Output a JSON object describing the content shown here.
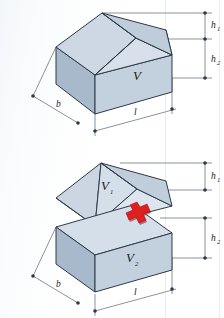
{
  "page": {
    "width": 224,
    "height": 318,
    "background": "#fdfdfd",
    "clipped_heading": "...icht Verfahren"
  },
  "figure": {
    "colors": {
      "face_light": "#d3dde8",
      "face_mid": "#c3d0dd",
      "face_dark": "#b3c2d2",
      "face_darkest": "#a8b9cb",
      "outline": "#2d3a46",
      "dimension_line": "#5a6672",
      "plus_sign": "#e02020",
      "plus_sign_shadow": "#8c1010",
      "text": "#1a1a1a"
    }
  },
  "top_diagram": {
    "name": "whole-solid",
    "volume_label": "V",
    "dimensions": [
      {
        "id": "b",
        "label": "b",
        "axis": "depth"
      },
      {
        "id": "l",
        "label": "l",
        "axis": "length"
      },
      {
        "id": "h1",
        "label": "h",
        "subscript": "1",
        "axis": "roof-height"
      },
      {
        "id": "h2",
        "label": "h",
        "subscript": "2",
        "axis": "wall-height"
      }
    ]
  },
  "bottom_diagram": {
    "name": "decomposed-solid",
    "upper_volume_label": "V",
    "upper_volume_subscript": "1",
    "lower_volume_label": "V",
    "lower_volume_subscript": "2",
    "operator": "+",
    "dimensions": [
      {
        "id": "b",
        "label": "b",
        "axis": "depth"
      },
      {
        "id": "l",
        "label": "l",
        "axis": "length"
      },
      {
        "id": "h1",
        "label": "h",
        "subscript": "1",
        "axis": "roof-height"
      },
      {
        "id": "h2",
        "label": "h",
        "subscript": "2",
        "axis": "cuboid-height"
      }
    ]
  }
}
